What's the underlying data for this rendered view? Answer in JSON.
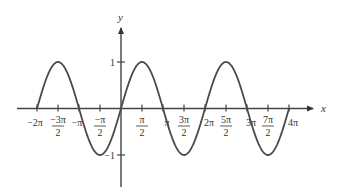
{
  "chart_data": {
    "type": "line",
    "title": "",
    "function": "y = sin x",
    "xlabel": "x",
    "ylabel": "y",
    "xlim": [
      -6.2832,
      12.5664
    ],
    "ylim": [
      -1,
      1
    ],
    "grid": false,
    "legend": null,
    "x_ticks": [
      {
        "value": -6.2832,
        "num": "−2π",
        "den": ""
      },
      {
        "value": -4.7124,
        "num": "−3π",
        "den": "2"
      },
      {
        "value": -3.1416,
        "num": "−π",
        "den": ""
      },
      {
        "value": -1.5708,
        "num": "−π",
        "den": "2"
      },
      {
        "value": 1.5708,
        "num": "π",
        "den": "2"
      },
      {
        "value": 3.1416,
        "num": "π",
        "den": ""
      },
      {
        "value": 4.7124,
        "num": "3π",
        "den": "2"
      },
      {
        "value": 6.2832,
        "num": "2π",
        "den": ""
      },
      {
        "value": 7.854,
        "num": "5π",
        "den": "2"
      },
      {
        "value": 9.4248,
        "num": "3π",
        "den": ""
      },
      {
        "value": 10.9956,
        "num": "7π",
        "den": "2"
      },
      {
        "value": 12.5664,
        "num": "4π",
        "den": ""
      }
    ],
    "y_ticks": [
      {
        "value": 1,
        "label": "1"
      },
      {
        "value": -1,
        "label": "−1"
      }
    ],
    "series": [
      {
        "name": "sin x",
        "color": "#444444",
        "x": [
          -6.2832,
          -4.7124,
          -3.1416,
          -1.5708,
          0,
          1.5708,
          3.1416,
          4.7124,
          6.2832,
          7.854,
          9.4248,
          10.9956,
          12.5664
        ],
        "y": [
          0,
          1,
          0,
          -1,
          0,
          1,
          0,
          -1,
          0,
          1,
          0,
          -1,
          0
        ]
      }
    ]
  }
}
